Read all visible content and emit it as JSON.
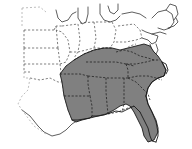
{
  "figure": {
    "type": "choropleth-map",
    "title": "",
    "width": 192,
    "height": 149,
    "background_color": "#ffffff",
    "highlighted_area_label": "Southeastern United States",
    "legend_present": false,
    "axis_present": false,
    "frame_present": false
  },
  "colors": {
    "highlight_fill": "#808080",
    "background": "#ffffff",
    "state_border": "#4a4a4a",
    "state_border_faint": "#9a9a9a",
    "state_border_dark": "#1c1c1c",
    "coastline": "#1a1a1a"
  },
  "map_data": {
    "shaded_states": [
      "Louisiana",
      "Mississippi",
      "Alabama",
      "Georgia",
      "Florida",
      "South Carolina",
      "North Carolina",
      "Tennessee",
      "Arkansas",
      "Kentucky",
      "Virginia"
    ],
    "unshaded_states_visible": [
      "Texas",
      "Oklahoma",
      "Kansas",
      "Nebraska",
      "Iowa",
      "Missouri",
      "Illinois",
      "Indiana",
      "Ohio",
      "Michigan",
      "Wisconsin",
      "Minnesota",
      "West Virginia",
      "Pennsylvania",
      "New York",
      "New England"
    ],
    "boundary_style": "dashed",
    "coast_style": "solid"
  },
  "annotations": []
}
